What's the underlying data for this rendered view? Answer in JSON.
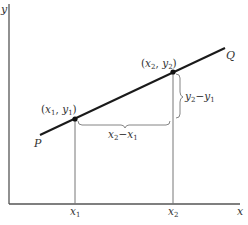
{
  "diagram": {
    "type": "slope-of-line",
    "axes": {
      "x_label": "x",
      "y_label": "y"
    },
    "line": {
      "start_label": "P",
      "end_label": "Q"
    },
    "points": [
      {
        "label": "(x1, y1)",
        "x_var": "x",
        "x_sub": "1",
        "y_var": "y",
        "y_sub": "1"
      },
      {
        "label": "(x2, y2)",
        "x_var": "x",
        "x_sub": "2",
        "y_var": "y",
        "y_sub": "2"
      }
    ],
    "ticks": [
      {
        "var": "x",
        "sub": "1"
      },
      {
        "var": "x",
        "sub": "2"
      }
    ],
    "run": {
      "label": "x2 − x1",
      "a": "x",
      "a_sub": "2",
      "minus": "−",
      "b": "x",
      "b_sub": "1"
    },
    "rise": {
      "label": "y2 − y1",
      "a": "y",
      "a_sub": "2",
      "minus": "−",
      "b": "y",
      "b_sub": "1"
    },
    "colors": {
      "line": "#1a1a1a",
      "axes": "#555555",
      "guides": "#777777",
      "text": "#333333"
    }
  }
}
